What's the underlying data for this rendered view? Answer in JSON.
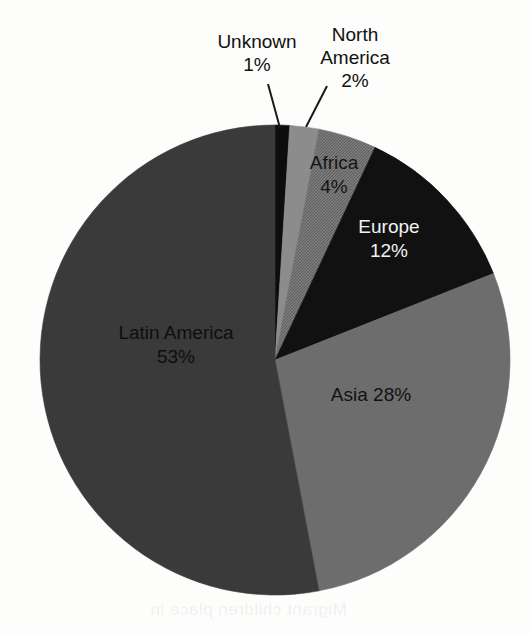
{
  "chart_data": {
    "type": "pie",
    "title": "",
    "subtitle": "",
    "xlabel": "",
    "ylabel": "",
    "legend_position": "none",
    "grid": false,
    "units": "percent",
    "start_angle_deg": 0,
    "direction": "clockwise",
    "categories": [
      "Unknown",
      "North America",
      "Africa",
      "Europe",
      "Asia",
      "Latin America"
    ],
    "values": [
      1,
      2,
      4,
      12,
      28,
      53
    ],
    "slices": [
      {
        "name": "Unknown",
        "label": "Unknown",
        "value": 1,
        "value_text": "1%",
        "color": "#0d0d0d",
        "texture": "solid",
        "label_placement": "callout",
        "label_color": "#111111",
        "label_lines": [
          "Unknown",
          "1%"
        ]
      },
      {
        "name": "North America",
        "label": "North America",
        "value": 2,
        "value_text": "2%",
        "color": "#8c8c8c",
        "texture": "solid",
        "label_placement": "callout",
        "label_color": "#111111",
        "label_lines": [
          "North",
          "America",
          "2%"
        ]
      },
      {
        "name": "Africa",
        "label": "Africa",
        "value": 4,
        "value_text": "4%",
        "color": "#6f6f6f",
        "texture": "dither",
        "label_placement": "inside",
        "label_color": "#151515",
        "label_lines": [
          "Africa",
          "4%"
        ]
      },
      {
        "name": "Europe",
        "label": "Europe",
        "value": 12,
        "value_text": "12%",
        "color": "#111111",
        "texture": "solid",
        "label_placement": "inside",
        "label_color": "#f2f2f2",
        "label_lines": [
          "Europe",
          "12%"
        ]
      },
      {
        "name": "Asia",
        "label": "Asia",
        "value": 28,
        "value_text": "28%",
        "color": "#6d6d6d",
        "texture": "solid",
        "label_placement": "inside",
        "label_color": "#121212",
        "label_lines": [
          "Asia 28%"
        ]
      },
      {
        "name": "Latin America",
        "label": "Latin America",
        "value": 53,
        "value_text": "53%",
        "color": "#3a3a3a",
        "texture": "solid",
        "label_placement": "inside",
        "label_color": "#0e0e0e",
        "label_lines": [
          "Latin America",
          "53%"
        ]
      }
    ],
    "geometry": {
      "center_x": 275,
      "center_y": 360,
      "radius": 235
    },
    "callouts": [
      {
        "name": "Unknown",
        "text_x": 257,
        "text_y": 48,
        "line_x1": 268,
        "line_y1": 84,
        "line_x2": 280,
        "line_y2": 128
      },
      {
        "name": "North America",
        "text_x": 355,
        "text_y": 41,
        "line_x1": 327,
        "line_y1": 86,
        "line_x2": 306,
        "line_y2": 127
      }
    ],
    "inside_labels": [
      {
        "name": "Africa",
        "x": 334,
        "y": 164
      },
      {
        "name": "Europe",
        "x": 389,
        "y": 228
      },
      {
        "name": "Asia",
        "x": 371,
        "y": 396
      },
      {
        "name": "Latin America",
        "x": 176,
        "y": 334
      }
    ]
  },
  "page": {
    "background_color": "#fdfdfc",
    "bleed_text": "Migrant children place in"
  }
}
